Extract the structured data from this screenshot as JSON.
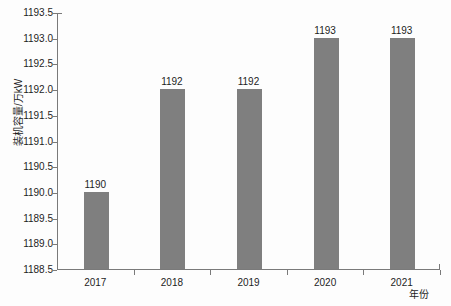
{
  "chart_data": {
    "type": "bar",
    "title": "",
    "subtitle": "",
    "xlabel": "年份",
    "ylabel": "装机容量/万kW",
    "categories": [
      "2017",
      "2018",
      "2019",
      "2020",
      "2021"
    ],
    "values": [
      1190,
      1192,
      1192,
      1193,
      1193
    ],
    "data_labels": [
      "1190",
      "1192",
      "1192",
      "1193",
      "1193"
    ],
    "ylim": [
      1188.5,
      1193.5
    ],
    "ytick_step": 0.5,
    "ytick_labels": [
      "1193.5",
      "1193.0",
      "1192.5",
      "1192.0",
      "1191.5",
      "1191.0",
      "1190.5",
      "1190.0",
      "1189.5",
      "1189.0",
      "1188.5"
    ],
    "ytick_values": [
      1193.5,
      1193.0,
      1192.5,
      1192.0,
      1191.5,
      1191.0,
      1190.5,
      1190.0,
      1189.5,
      1189.0,
      1188.5
    ],
    "grid": false,
    "legend": false,
    "legend_position": "none",
    "series": [
      {
        "name": "装机容量",
        "values": [
          1190,
          1192,
          1192,
          1193,
          1193
        ],
        "color": "#7f7f7f"
      }
    ],
    "colors": {
      "bar": "#7f7f7f",
      "axis": "#7a7a7a",
      "text": "#1d1d1d",
      "background": "#fdfdfd"
    }
  }
}
